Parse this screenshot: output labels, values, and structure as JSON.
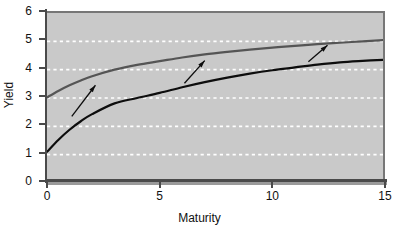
{
  "chart_data": {
    "type": "line",
    "title": "",
    "xlabel": "Maturity",
    "ylabel": "Yield",
    "xlim": [
      0,
      15
    ],
    "ylim": [
      0,
      6
    ],
    "xticks": [
      0,
      5,
      10,
      15
    ],
    "yticks": [
      0,
      1,
      2,
      3,
      4,
      5,
      6
    ],
    "xtick_labels": [
      "0",
      "5",
      "10",
      "15"
    ],
    "ytick_labels": [
      "0",
      "1",
      "2",
      "3",
      "4",
      "5",
      "6"
    ],
    "grid": true,
    "grid_style": "dashed-white-horizontal",
    "legend": "none",
    "background_color": "#c9c9c9",
    "series": [
      {
        "name": "upper-yield-curve",
        "color": "#555555",
        "x": [
          0,
          0.5,
          1,
          1.5,
          2,
          3,
          4,
          5,
          6,
          7,
          8,
          9,
          10,
          11,
          12,
          13,
          14,
          15
        ],
        "y": [
          3.02,
          3.25,
          3.45,
          3.62,
          3.77,
          4.0,
          4.17,
          4.3,
          4.43,
          4.54,
          4.63,
          4.71,
          4.78,
          4.84,
          4.9,
          4.95,
          5.0,
          5.05
        ]
      },
      {
        "name": "lower-yield-curve",
        "color": "#0d0d0d",
        "x": [
          0,
          0.5,
          1,
          1.5,
          2,
          3,
          4,
          5,
          6,
          7,
          8,
          9,
          10,
          11,
          12,
          13,
          14,
          15
        ],
        "y": [
          1.1,
          1.52,
          1.88,
          2.18,
          2.43,
          2.81,
          3.0,
          3.18,
          3.38,
          3.56,
          3.72,
          3.86,
          3.98,
          4.08,
          4.18,
          4.26,
          4.31,
          4.35
        ]
      }
    ],
    "annotations": [
      {
        "name": "shift-arrow-left",
        "kind": "arrow",
        "from_x": 1.1,
        "from_y": 2.35,
        "to_x": 2.15,
        "to_y": 3.45,
        "color": "#0d0d0d"
      },
      {
        "name": "shift-arrow-middle",
        "kind": "arrow",
        "from_x": 6.1,
        "from_y": 3.52,
        "to_x": 7.0,
        "to_y": 4.32,
        "color": "#0d0d0d"
      },
      {
        "name": "shift-arrow-right",
        "kind": "arrow",
        "from_x": 11.6,
        "from_y": 4.28,
        "to_x": 12.45,
        "to_y": 4.86,
        "color": "#0d0d0d"
      }
    ]
  }
}
